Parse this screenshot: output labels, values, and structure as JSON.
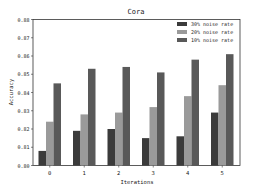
{
  "chart_data": {
    "type": "bar",
    "title": "Cora",
    "xlabel": "Iterations",
    "ylabel": "Accuracy",
    "categories": [
      "0",
      "1",
      "2",
      "3",
      "4",
      "5"
    ],
    "ylim": [
      0.8,
      0.88
    ],
    "yticks": [
      "0.80",
      "0.81",
      "0.82",
      "0.83",
      "0.84",
      "0.85",
      "0.86",
      "0.87",
      "0.88"
    ],
    "grid": false,
    "legend_position": "upper right",
    "series": [
      {
        "name": "30% noise rate",
        "color": "#3b3b3b",
        "values": [
          0.808,
          0.819,
          0.82,
          0.815,
          0.816,
          0.829
        ]
      },
      {
        "name": "20% noise rate",
        "color": "#9a9a9a",
        "values": [
          0.824,
          0.828,
          0.829,
          0.832,
          0.838,
          0.844
        ]
      },
      {
        "name": "10% noise rate",
        "color": "#595959",
        "values": [
          0.845,
          0.853,
          0.854,
          0.851,
          0.858,
          0.861
        ]
      }
    ]
  }
}
